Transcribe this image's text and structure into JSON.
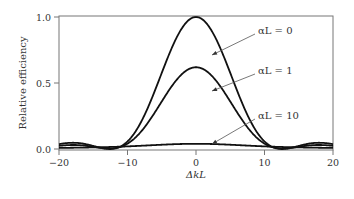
{
  "chart_data": {
    "type": "line",
    "title": "",
    "xlabel": "ΔkL",
    "ylabel": "Relative efficiency",
    "xlim": [
      -20,
      20
    ],
    "ylim": [
      0,
      1.0
    ],
    "xticks": [
      -20,
      -10,
      0,
      10,
      20
    ],
    "xtick_labels": [
      "−20",
      "−10",
      "0",
      "10",
      "20"
    ],
    "yticks": [
      0.0,
      0.5,
      1.0
    ],
    "ytick_labels": [
      "0.0",
      "0.5",
      "1.0"
    ],
    "grid": false,
    "legend": "annotations with arrows",
    "x": [
      -20,
      -18,
      -16,
      -14,
      -12,
      -10,
      -8,
      -6,
      -5,
      -4,
      -3,
      -2,
      -1,
      0,
      1,
      2,
      3,
      4,
      5,
      6,
      8,
      10,
      12,
      14,
      16,
      18,
      20
    ],
    "series": [
      {
        "name": "αL = 0",
        "alphaL": 0,
        "values": [
          0.007,
          0.012,
          0.001,
          0.005,
          0.0,
          0.022,
          0.019,
          0.002,
          0.08,
          0.26,
          0.5,
          0.71,
          0.92,
          1.0,
          0.92,
          0.71,
          0.5,
          0.26,
          0.08,
          0.002,
          0.019,
          0.022,
          0.0,
          0.005,
          0.001,
          0.012,
          0.007
        ]
      },
      {
        "name": "αL = 1",
        "alphaL": 1,
        "values": [
          0.009,
          0.01,
          0.003,
          0.004,
          0.003,
          0.018,
          0.017,
          0.012,
          0.06,
          0.18,
          0.33,
          0.46,
          0.57,
          0.62,
          0.57,
          0.46,
          0.33,
          0.18,
          0.06,
          0.012,
          0.017,
          0.018,
          0.003,
          0.004,
          0.003,
          0.01,
          0.009
        ]
      },
      {
        "name": "αL = 10",
        "alphaL": 10,
        "values": [
          0.008,
          0.009,
          0.01,
          0.011,
          0.013,
          0.015,
          0.019,
          0.024,
          0.027,
          0.031,
          0.034,
          0.037,
          0.039,
          0.04,
          0.039,
          0.037,
          0.034,
          0.031,
          0.027,
          0.024,
          0.019,
          0.015,
          0.013,
          0.011,
          0.01,
          0.009,
          0.008
        ]
      }
    ],
    "annotations": [
      {
        "text": "αL = 0",
        "points_to_series": "αL = 0"
      },
      {
        "text": "αL = 1",
        "points_to_series": "αL = 1"
      },
      {
        "text": "αL = 10",
        "points_to_series": "αL = 10"
      }
    ]
  }
}
